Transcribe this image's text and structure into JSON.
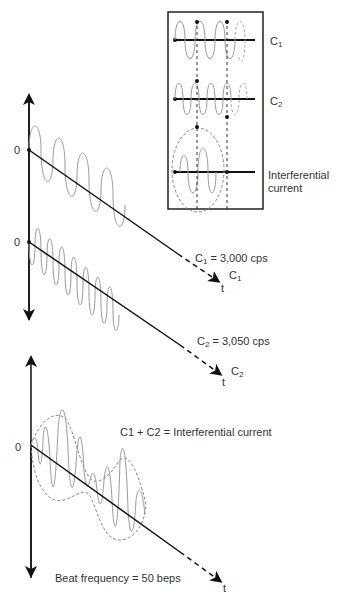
{
  "inset": {
    "label_c1": "C",
    "label_c1_sub": "1",
    "label_c2": "C",
    "label_c2_sub": "2",
    "label_ic_line1": "Interferential",
    "label_ic_line2": "current"
  },
  "panel1": {
    "origin_label": "0",
    "eq_main": "C",
    "eq_sub": "1",
    "eq_rest": " = 3,000 cps",
    "axis_t": "t",
    "curve_label": "C",
    "curve_sub": "1"
  },
  "panel2": {
    "origin_label": "0",
    "eq_main": "C",
    "eq_sub": "2",
    "eq_rest": " = 3,050 cps",
    "axis_t": "t",
    "curve_label": "C",
    "curve_sub": "2"
  },
  "panel3": {
    "origin_label": "0",
    "equation": "C1 + C2 = Interferential current",
    "beat": "Beat frequency = 50 beps",
    "axis_t": "t"
  },
  "colors": {
    "line": "#111111",
    "wave": "#9a9a9a",
    "dash": "#888888"
  }
}
